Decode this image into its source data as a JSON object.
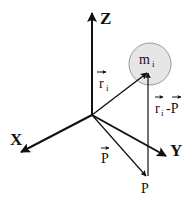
{
  "diagram": {
    "type": "3d-coordinate-vector-diagram",
    "axes": {
      "x": {
        "label": "X"
      },
      "y": {
        "label": "Y"
      },
      "z": {
        "label": "Z"
      }
    },
    "mass": {
      "label": "m",
      "subscript": "i",
      "fill": "#e6e6e6",
      "stroke": "#888888"
    },
    "vectors": {
      "r_i": {
        "label": "r",
        "subscript": "i"
      },
      "P": {
        "label": "P"
      },
      "r_i_minus_P": {
        "label_r": "r",
        "subscript": "i",
        "label_rest": "-P"
      }
    },
    "point": {
      "label": "P"
    },
    "colors": {
      "ink": "#111111",
      "background": "#ffffff"
    }
  }
}
